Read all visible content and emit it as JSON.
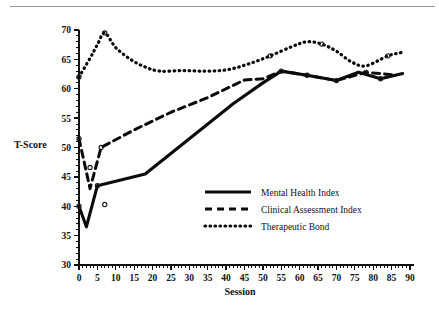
{
  "figure": {
    "has_top_rule": true,
    "background": "#ffffff",
    "ink_color": "#0b0b0b"
  },
  "axis_titles": {
    "y": "T-Score",
    "x": "Session"
  },
  "legend": {
    "entries": [
      {
        "label": "Mental Health Index",
        "style": "solid"
      },
      {
        "label": "Clinical Assessment Index",
        "style": "dashed"
      },
      {
        "label": "Therapeutic Bond",
        "style": "dotted"
      }
    ]
  },
  "chart_data": {
    "type": "line",
    "title": "",
    "xlabel": "Session",
    "ylabel": "T-Score",
    "xlim": [
      0,
      90
    ],
    "ylim": [
      30,
      70
    ],
    "xticks": [
      0,
      5,
      10,
      15,
      20,
      25,
      30,
      35,
      40,
      45,
      50,
      55,
      60,
      65,
      70,
      75,
      80,
      85,
      90
    ],
    "yticks": [
      30,
      35,
      40,
      45,
      50,
      55,
      60,
      65,
      70
    ],
    "xtick_labels": [
      "0",
      "5",
      "10",
      "15",
      "20",
      "25",
      "30",
      "35",
      "40",
      "45",
      "50",
      "55",
      "60",
      "65",
      "70",
      "75",
      "80",
      "85",
      "90"
    ],
    "ytick_labels": [
      "30",
      "35",
      "40",
      "45",
      "50",
      "55",
      "60",
      "65",
      "70"
    ],
    "grid": false,
    "legend_position": "lower-right-inside",
    "series": [
      {
        "name": "Mental Health Index",
        "style": "solid",
        "x": [
          0,
          2,
          5,
          18,
          30,
          42,
          50,
          55,
          62,
          70,
          76,
          82,
          88
        ],
        "values": [
          40.0,
          36.5,
          43.5,
          45.5,
          51.5,
          57.5,
          61.0,
          63.0,
          62.3,
          61.4,
          62.8,
          61.7,
          62.6
        ]
      },
      {
        "name": "Clinical Assessment Index",
        "style": "dashed",
        "x": [
          0,
          3,
          6,
          15,
          25,
          35,
          45,
          50,
          55,
          62,
          70,
          78,
          85
        ],
        "values": [
          51.5,
          43.0,
          50.0,
          53.0,
          56.0,
          58.5,
          61.5,
          61.7,
          63.0,
          62.3,
          61.4,
          62.8,
          62.4
        ]
      },
      {
        "name": "Therapeutic Bond",
        "style": "dotted",
        "x": [
          0,
          3,
          5,
          7,
          10,
          14,
          18,
          22,
          28,
          34,
          40,
          46,
          52,
          58,
          62,
          66,
          70,
          74,
          78,
          84,
          88
        ],
        "values": [
          62.0,
          65.2,
          67.5,
          69.5,
          67.0,
          65.0,
          63.7,
          63.0,
          63.1,
          63.0,
          63.2,
          64.2,
          65.6,
          67.2,
          68.0,
          67.6,
          66.4,
          64.6,
          63.9,
          65.6,
          66.2
        ]
      }
    ],
    "markers": [
      {
        "series": "Mental Health Index",
        "x": 0,
        "y": 40.0
      },
      {
        "series": "Mental Health Index",
        "x": 5,
        "y": 43.5
      },
      {
        "series": "Mental Health Index",
        "x": 7,
        "y": 40.3
      },
      {
        "series": "Mental Health Index",
        "x": 55,
        "y": 63.0
      },
      {
        "series": "Mental Health Index",
        "x": 70,
        "y": 61.4
      },
      {
        "series": "Mental Health Index",
        "x": 82,
        "y": 61.7
      },
      {
        "series": "Clinical Assessment Index",
        "x": 0,
        "y": 51.5
      },
      {
        "series": "Clinical Assessment Index",
        "x": 6,
        "y": 50.0
      },
      {
        "series": "Clinical Assessment Index",
        "x": 3,
        "y": 46.6
      },
      {
        "series": "Clinical Assessment Index",
        "x": 62,
        "y": 62.3
      },
      {
        "series": "Clinical Assessment Index",
        "x": 78,
        "y": 62.8
      },
      {
        "series": "Therapeutic Bond",
        "x": 0,
        "y": 62.0
      },
      {
        "series": "Therapeutic Bond",
        "x": 7,
        "y": 69.5
      },
      {
        "series": "Therapeutic Bond",
        "x": 52,
        "y": 65.6
      },
      {
        "series": "Therapeutic Bond",
        "x": 66,
        "y": 67.6
      },
      {
        "series": "Therapeutic Bond",
        "x": 84,
        "y": 65.6
      }
    ]
  },
  "geometry": {
    "plot_left": 79,
    "plot_right": 410,
    "plot_top": 30,
    "plot_bottom": 265
  }
}
